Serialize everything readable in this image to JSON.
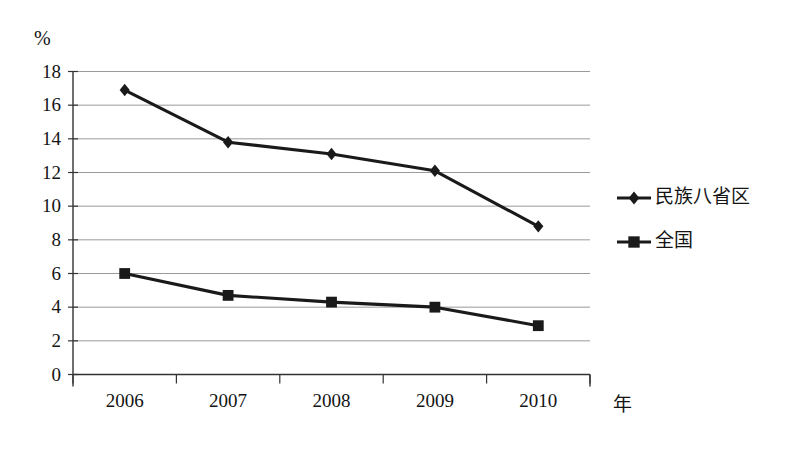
{
  "chart_data": {
    "type": "line",
    "title": "",
    "subtitle": "",
    "xlabel": "年",
    "ylabel": "%",
    "categories": [
      "2006",
      "2007",
      "2008",
      "2009",
      "2010"
    ],
    "x": [
      2006,
      2007,
      2008,
      2009,
      2010
    ],
    "ylim": [
      0,
      18
    ],
    "ytick_values": [
      0,
      2,
      4,
      6,
      8,
      10,
      12,
      14,
      16,
      18
    ],
    "ytick_labels": [
      "0",
      "2",
      "4",
      "6",
      "8",
      "10",
      "12",
      "14",
      "16",
      "18"
    ],
    "grid": true,
    "grid_axis": "y",
    "legend_position": "right",
    "series": [
      {
        "name": "民族八省区",
        "marker": "diamond",
        "color": "#1a1a1a",
        "values": [
          16.9,
          13.8,
          13.1,
          12.1,
          8.8
        ]
      },
      {
        "name": "全国",
        "marker": "square",
        "color": "#1a1a1a",
        "values": [
          6.0,
          4.7,
          4.3,
          4.0,
          2.9
        ]
      }
    ]
  },
  "axes": {
    "y_unit": "%",
    "x_unit": "年"
  },
  "legend": {
    "items": [
      {
        "label": "民族八省区",
        "marker": "diamond"
      },
      {
        "label": "全国",
        "marker": "square"
      }
    ]
  },
  "colors": {
    "series": "#1a1a1a",
    "grid": "#9a9a9a",
    "axis": "#333333",
    "background": "#ffffff"
  }
}
